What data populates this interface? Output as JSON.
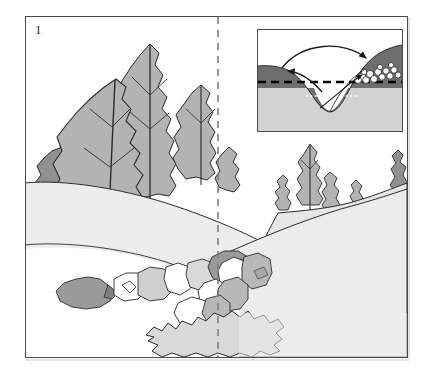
{
  "figure": {
    "number": "1",
    "caption_visible": false,
    "frame": {
      "x": 25,
      "y": 16,
      "width": 383,
      "height": 342,
      "border_color": "#4a4a4a"
    }
  },
  "divider": {
    "name": "dashed-vertical-divider",
    "x": 217,
    "style": "dashed",
    "color": "#7d7d7d"
  },
  "palette": {
    "background": "#ffffff",
    "foliage_light": "#b3b3b3",
    "foliage_dark": "#909090",
    "ground_light": "#ececec",
    "ground_mid": "#e2e2e2",
    "rock_light": "#d9d9d9",
    "rock_mid": "#b8b8b8",
    "rock_dark": "#9a9a9a",
    "outline": "#2b2b2b",
    "soil_dark": "#6e6e6e",
    "bedrock_light": "#d2d2d2",
    "gravel_white": "#ffffff"
  },
  "main_scene": {
    "name": "landscape-cross-valley-view",
    "elements": [
      {
        "name": "foreground-hill-slope",
        "type": "landform",
        "fill": "#ececec"
      },
      {
        "name": "tree-cluster-left",
        "type": "vegetation",
        "count": 5,
        "shape": "leaf"
      },
      {
        "name": "tree-cluster-right",
        "type": "vegetation",
        "count": 4,
        "shape": "leaf"
      },
      {
        "name": "tree-far-right-edge",
        "type": "vegetation",
        "count": 1,
        "shape": "leaf"
      },
      {
        "name": "mid-hill-slope",
        "type": "landform",
        "fill": "#e6e6e6"
      },
      {
        "name": "boulder-train-upper",
        "type": "rocks",
        "count": 6
      },
      {
        "name": "boulder-train-lower",
        "type": "rocks",
        "count": 5
      },
      {
        "name": "gravel-bar-bottom",
        "type": "rocks",
        "count": 1
      }
    ]
  },
  "inset": {
    "name": "stream-meander-cross-section",
    "frame": {
      "x": 231,
      "y": 12,
      "width": 146,
      "height": 103
    },
    "layers": [
      {
        "name": "soil-layer",
        "fill": "#6e6e6e",
        "label": "dark upper unit"
      },
      {
        "name": "bedrock-layer",
        "fill": "#d2d2d2",
        "label": "light lower unit"
      }
    ],
    "lines": [
      {
        "name": "water-table-dashed-line",
        "style": "dashed",
        "color": "#000000",
        "weight": 2.2
      },
      {
        "name": "lower-dotted-line",
        "style": "dotted",
        "color": "#ffffff",
        "weight": 1.4
      }
    ],
    "arrows": [
      {
        "name": "arrow-long-left-to-right",
        "direction": "right",
        "type": "curved"
      },
      {
        "name": "arrow-short-right-to-left",
        "direction": "left",
        "type": "curved"
      },
      {
        "name": "arrow-lower-right",
        "direction": "right",
        "type": "curved"
      }
    ],
    "deposit": {
      "name": "gravel-cobble-deposit",
      "fill": "#ffffff",
      "count": 14
    },
    "channel": {
      "name": "incised-channel-profile",
      "shape": "u-valley"
    }
  }
}
